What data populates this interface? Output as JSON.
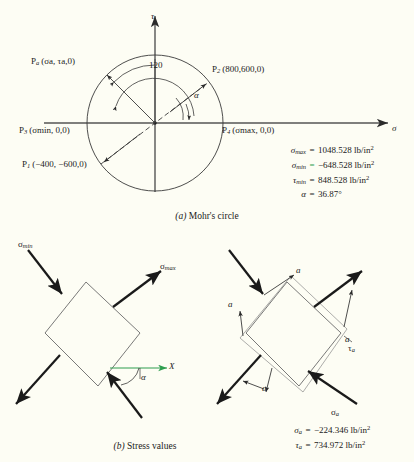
{
  "figure": {
    "background_color": "#fdfdf4",
    "line_color": "#2b2b2b",
    "accent_color": "#2f9e4f"
  },
  "panel_a": {
    "caption_label": "(a)",
    "caption_text": "Mohr's circle",
    "axes": {
      "vertical_axis_label": "τ",
      "horizontal_axis_label": "σ"
    },
    "angle_labels": {
      "inner_angle": "120",
      "alpha": "α"
    },
    "points": [
      {
        "name": "Pa",
        "base": "P",
        "sub": "a",
        "coords": "(σa, τa,0)"
      },
      {
        "name": "P2",
        "base": "P",
        "sub": "2",
        "coords": "(800,600,0)"
      },
      {
        "name": "P3",
        "base": "P",
        "sub": "3",
        "coords": "(σmin, 0,0)"
      },
      {
        "name": "P4",
        "base": "P",
        "sub": "4",
        "coords": "(σmax, 0,0)"
      },
      {
        "name": "P1",
        "base": "P",
        "sub": "1",
        "coords": "(−400, −600,0)"
      }
    ],
    "results": [
      {
        "symbol": "σ",
        "subscript": "max",
        "equals": "=",
        "value": "1048.528 lb/in",
        "exponent": "2",
        "highlight": false
      },
      {
        "symbol": "σ",
        "subscript": "min",
        "equals": "=",
        "value": "−648.528 lb/in",
        "exponent": "2",
        "highlight": true
      },
      {
        "symbol": "τ",
        "subscript": "min",
        "equals": "=",
        "value": "848.528 lb/in",
        "exponent": "2",
        "highlight": false
      },
      {
        "symbol": "α",
        "subscript": "",
        "equals": "=",
        "value": "36.87°",
        "exponent": "",
        "highlight": false
      }
    ]
  },
  "panel_b": {
    "caption_label": "(b)",
    "caption_text": "Stress values",
    "left_diagram": {
      "sigma_min_label": "σmin",
      "sigma_max_label": "σmax",
      "x_axis_label": "X",
      "alpha_label": "α"
    },
    "right_diagram": {
      "corner_labels": [
        "a",
        "a",
        "a",
        "a"
      ],
      "tau_a_label": "τa",
      "sigma_a_label": "σa"
    },
    "results": [
      {
        "symbol": "σ",
        "subscript": "a",
        "equals": "=",
        "value": "−224.346 lb/in",
        "exponent": "2"
      },
      {
        "symbol": "τ",
        "subscript": "a",
        "equals": "=",
        "value": "734.972 lb/in",
        "exponent": "2"
      }
    ]
  }
}
